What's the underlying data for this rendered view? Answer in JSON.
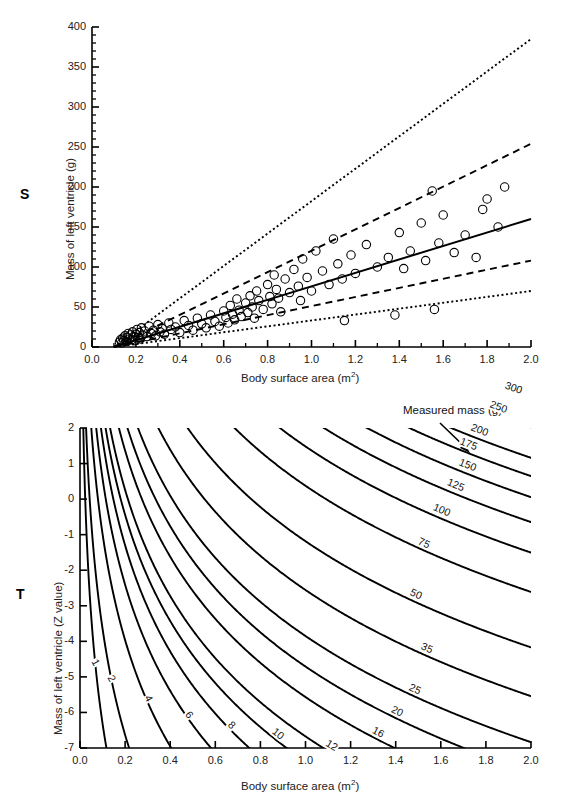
{
  "figure": {
    "panels": [
      {
        "letter": "S",
        "xlabel_main": "Body surface area (m",
        "xlabel_sup": "2",
        "xlabel_tail": ")",
        "ylabel": "Mass of left ventricle (g)"
      },
      {
        "letter": "T",
        "xlabel_main": "Body surface area (m",
        "xlabel_sup": "2",
        "xlabel_tail": ")",
        "ylabel": "Mass of left ventricle (Z value)",
        "annotation": "Measured mass (g)"
      }
    ]
  },
  "chart_data": [
    {
      "type": "scatter",
      "panel": "S",
      "title": "",
      "xlabel": "Body surface area (m2)",
      "ylabel": "Mass of left ventricle (g)",
      "xlim": [
        0.0,
        2.0
      ],
      "ylim": [
        0,
        400
      ],
      "xticks": [
        0.0,
        0.2,
        0.4,
        0.6,
        0.8,
        1.0,
        1.2,
        1.4,
        1.6,
        1.8,
        2.0
      ],
      "xtick_labels": [
        "0.0",
        "0.2",
        "0.4",
        "0.6",
        "0.8",
        "1.0",
        "1.2",
        "1.4",
        "1.6",
        "1.8",
        "2.0"
      ],
      "yticks": [
        0,
        50,
        100,
        150,
        200,
        250,
        300,
        350,
        400
      ],
      "ytick_labels": [
        "0",
        "50",
        "100",
        "150",
        "200",
        "250",
        "300",
        "350",
        "400"
      ],
      "minor_tick_count_y": 5,
      "minor_tick_count_x": 2,
      "grid": false,
      "legend": "none",
      "marker": "open-circle",
      "points": [
        [
          0.125,
          6
        ],
        [
          0.13,
          9
        ],
        [
          0.135,
          5
        ],
        [
          0.14,
          11
        ],
        [
          0.145,
          8
        ],
        [
          0.15,
          14
        ],
        [
          0.155,
          7
        ],
        [
          0.16,
          12
        ],
        [
          0.165,
          17
        ],
        [
          0.17,
          10
        ],
        [
          0.175,
          15
        ],
        [
          0.18,
          9
        ],
        [
          0.185,
          19
        ],
        [
          0.19,
          13
        ],
        [
          0.195,
          8
        ],
        [
          0.2,
          16
        ],
        [
          0.205,
          22
        ],
        [
          0.21,
          12
        ],
        [
          0.215,
          18
        ],
        [
          0.22,
          10
        ],
        [
          0.225,
          24
        ],
        [
          0.23,
          15
        ],
        [
          0.24,
          20
        ],
        [
          0.25,
          13
        ],
        [
          0.26,
          26
        ],
        [
          0.27,
          17
        ],
        [
          0.28,
          21
        ],
        [
          0.29,
          14
        ],
        [
          0.3,
          28
        ],
        [
          0.31,
          19
        ],
        [
          0.32,
          23
        ],
        [
          0.33,
          16
        ],
        [
          0.35,
          30
        ],
        [
          0.36,
          22
        ],
        [
          0.38,
          25
        ],
        [
          0.4,
          18
        ],
        [
          0.42,
          33
        ],
        [
          0.44,
          27
        ],
        [
          0.46,
          21
        ],
        [
          0.48,
          36
        ],
        [
          0.5,
          29
        ],
        [
          0.52,
          24
        ],
        [
          0.54,
          40
        ],
        [
          0.56,
          32
        ],
        [
          0.58,
          26
        ],
        [
          0.6,
          45
        ],
        [
          0.61,
          37
        ],
        [
          0.62,
          30
        ],
        [
          0.63,
          52
        ],
        [
          0.64,
          41
        ],
        [
          0.65,
          34
        ],
        [
          0.66,
          60
        ],
        [
          0.67,
          46
        ],
        [
          0.68,
          38
        ],
        [
          0.7,
          55
        ],
        [
          0.71,
          43
        ],
        [
          0.72,
          64
        ],
        [
          0.73,
          50
        ],
        [
          0.74,
          36
        ],
        [
          0.75,
          70
        ],
        [
          0.76,
          58
        ],
        [
          0.78,
          47
        ],
        [
          0.8,
          78
        ],
        [
          0.81,
          63
        ],
        [
          0.82,
          54
        ],
        [
          0.83,
          90
        ],
        [
          0.84,
          72
        ],
        [
          0.85,
          61
        ],
        [
          0.86,
          44
        ],
        [
          0.88,
          85
        ],
        [
          0.9,
          68
        ],
        [
          0.92,
          97
        ],
        [
          0.94,
          76
        ],
        [
          0.95,
          58
        ],
        [
          0.96,
          110
        ],
        [
          0.98,
          87
        ],
        [
          1.0,
          70
        ],
        [
          1.02,
          120
        ],
        [
          1.05,
          95
        ],
        [
          1.08,
          78
        ],
        [
          1.1,
          135
        ],
        [
          1.12,
          104
        ],
        [
          1.14,
          85
        ],
        [
          1.15,
          33
        ],
        [
          1.18,
          115
        ],
        [
          1.2,
          92
        ],
        [
          1.25,
          128
        ],
        [
          1.3,
          100
        ],
        [
          1.35,
          112
        ],
        [
          1.38,
          40
        ],
        [
          1.4,
          143
        ],
        [
          1.42,
          98
        ],
        [
          1.45,
          120
        ],
        [
          1.5,
          155
        ],
        [
          1.52,
          108
        ],
        [
          1.55,
          195
        ],
        [
          1.56,
          47
        ],
        [
          1.58,
          130
        ],
        [
          1.6,
          165
        ],
        [
          1.65,
          118
        ],
        [
          1.7,
          140
        ],
        [
          1.75,
          112
        ],
        [
          1.78,
          172
        ],
        [
          1.8,
          185
        ],
        [
          1.85,
          150
        ],
        [
          1.88,
          200
        ]
      ],
      "reference_lines": [
        {
          "name": "upper-outer",
          "style": "dotted",
          "from": [
            0.1,
            0
          ],
          "to": [
            2.0,
            385
          ]
        },
        {
          "name": "upper-inner",
          "style": "dashed",
          "from": [
            0.1,
            0
          ],
          "to": [
            2.0,
            254
          ]
        },
        {
          "name": "median",
          "style": "solid",
          "from": [
            0.1,
            0
          ],
          "to": [
            2.0,
            160
          ]
        },
        {
          "name": "lower-inner",
          "style": "dashed",
          "from": [
            0.1,
            0
          ],
          "to": [
            2.0,
            108
          ]
        },
        {
          "name": "lower-outer",
          "style": "dotted",
          "from": [
            0.1,
            0
          ],
          "to": [
            2.0,
            70
          ]
        }
      ]
    },
    {
      "type": "line",
      "panel": "T",
      "title": "",
      "xlabel": "Body surface area (m2)",
      "ylabel": "Mass of left ventricle (Z value)",
      "annotation": "Measured mass (g)",
      "xlim": [
        0.0,
        2.0
      ],
      "ylim": [
        -7,
        2
      ],
      "xticks": [
        0.0,
        0.2,
        0.4,
        0.6,
        0.8,
        1.0,
        1.2,
        1.4,
        1.6,
        1.8,
        2.0
      ],
      "xtick_labels": [
        "0.0",
        "0.2",
        "0.4",
        "0.6",
        "0.8",
        "1.0",
        "1.2",
        "1.4",
        "1.6",
        "1.8",
        "2.0"
      ],
      "yticks": [
        2,
        1,
        0,
        -1,
        -2,
        -3,
        -4,
        -5,
        -6,
        -7
      ],
      "ytick_labels": [
        "2",
        "1",
        "0",
        "-1",
        "-2",
        "-3",
        "-4",
        "-5",
        "-6",
        "-7"
      ],
      "grid": false,
      "legend": "none",
      "contour_levels": [
        1,
        2,
        4,
        6,
        8,
        10,
        12,
        16,
        20,
        25,
        35,
        50,
        75,
        100,
        125,
        150,
        175,
        200,
        250,
        300
      ],
      "contour_labels": [
        "1",
        "2",
        "4",
        "6",
        "8",
        "10",
        "12",
        "16",
        "20",
        "25",
        "35",
        "50",
        "75",
        "100",
        "125",
        "150",
        "175",
        "200",
        "250",
        "300"
      ]
    }
  ]
}
